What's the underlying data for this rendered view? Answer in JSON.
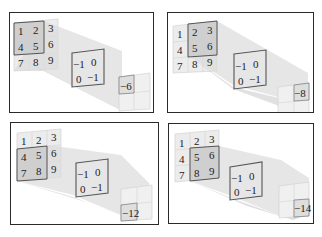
{
  "diagram": {
    "input_matrix": [
      [
        1,
        2,
        3
      ],
      [
        4,
        5,
        6
      ],
      [
        7,
        8,
        9
      ]
    ],
    "kernel": [
      [
        -1,
        0
      ],
      [
        0,
        -1
      ]
    ],
    "colors": {
      "frame": "#2a2a2a",
      "cell_light": "#ececec",
      "cell_active": "#c8c8c8",
      "beam": "#d9d9d9",
      "kernel_border": "#555555"
    },
    "panels": [
      {
        "id": 1,
        "window": [
          [
            1,
            2
          ],
          [
            4,
            5
          ]
        ],
        "window_pos": "top-left",
        "output": "-6",
        "output_pos": "top-left"
      },
      {
        "id": 2,
        "window": [
          [
            2,
            3
          ],
          [
            5,
            6
          ]
        ],
        "window_pos": "top-right",
        "output": "-8",
        "output_pos": "top-right"
      },
      {
        "id": 3,
        "window": [
          [
            4,
            5
          ],
          [
            7,
            8
          ]
        ],
        "window_pos": "bottom-left",
        "output": "-12",
        "output_pos": "bottom-left"
      },
      {
        "id": 4,
        "window": [
          [
            5,
            6
          ],
          [
            8,
            9
          ]
        ],
        "window_pos": "bottom-right",
        "output": "-14",
        "output_pos": "bottom-right"
      }
    ],
    "labels": {
      "in": [
        "1",
        "2",
        "3",
        "4",
        "5",
        "6",
        "7",
        "8",
        "9"
      ],
      "k": [
        "−1",
        "0",
        "0",
        "−1"
      ],
      "out1": "−6",
      "out2": "−8",
      "out3": "−12",
      "out4": "−14"
    }
  }
}
